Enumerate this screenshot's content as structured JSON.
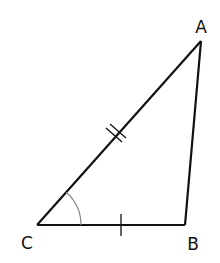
{
  "diagram": {
    "type": "triangle",
    "vertices": [
      {
        "name": "A",
        "x": 201,
        "y": 41,
        "label_x": 201,
        "label_y": 33
      },
      {
        "name": "B",
        "x": 185,
        "y": 225,
        "label_x": 192,
        "label_y": 249
      },
      {
        "name": "C",
        "x": 37,
        "y": 225,
        "label_x": 26,
        "label_y": 248
      }
    ],
    "sides": [
      {
        "from": "C",
        "to": "A",
        "tick_marks": 2
      },
      {
        "from": "C",
        "to": "B",
        "tick_marks": 1
      },
      {
        "from": "B",
        "to": "A",
        "tick_marks": 0
      }
    ],
    "angle_marks": [
      {
        "vertex": "C",
        "arcs": 1
      }
    ],
    "colors": {
      "stroke": "#111111",
      "arc": "#888888",
      "background": "#ffffff"
    }
  },
  "labels": {
    "A": "A",
    "B": "B",
    "C": "C"
  }
}
